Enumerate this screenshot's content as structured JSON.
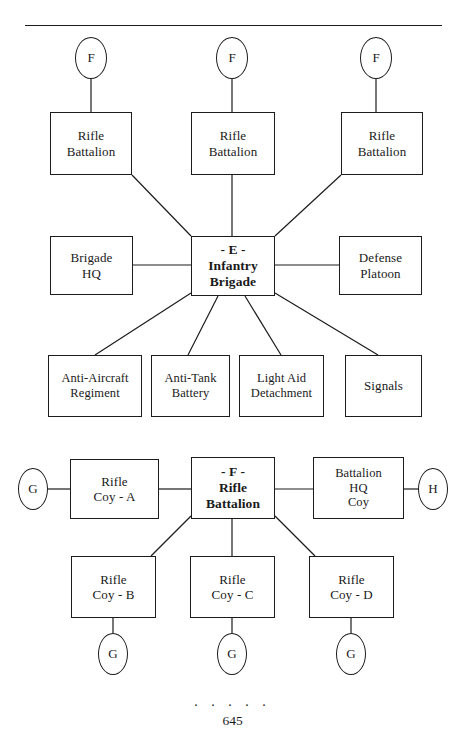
{
  "page": {
    "page_number": "645",
    "footer_dots": ". . . . .",
    "separator_rule": true
  },
  "diagram_e": {
    "title_code": "- E -",
    "center": {
      "lines": [
        "- E -",
        "Infantry",
        "Brigade"
      ]
    },
    "top_row_units": [
      {
        "lines": [
          "Rifle",
          "Battalion"
        ],
        "badge": "F"
      },
      {
        "lines": [
          "Rifle",
          "Battalion"
        ],
        "badge": "F"
      },
      {
        "lines": [
          "Rifle",
          "Battalion"
        ],
        "badge": "F"
      }
    ],
    "left_unit": {
      "lines": [
        "Brigade",
        "HQ"
      ]
    },
    "right_unit": {
      "lines": [
        "Defense",
        "Platoon"
      ]
    },
    "bottom_row_units": [
      {
        "lines": [
          "Anti-Aircraft",
          "Regiment"
        ]
      },
      {
        "lines": [
          "Anti-Tank",
          "Battery"
        ]
      },
      {
        "lines": [
          "Light Aid",
          "Detachment"
        ]
      },
      {
        "lines": [
          "Signals"
        ]
      }
    ]
  },
  "diagram_f": {
    "title_code": "- F -",
    "center": {
      "lines": [
        "- F -",
        "Rifle",
        "Battalion"
      ]
    },
    "left_unit": {
      "lines": [
        "Rifle",
        "Coy - A"
      ],
      "badge": "G"
    },
    "right_unit": {
      "lines": [
        "Battalion",
        "HQ",
        "Coy"
      ],
      "badge": "H"
    },
    "bottom_row_units": [
      {
        "lines": [
          "Rifle",
          "Coy - B"
        ],
        "badge": "G"
      },
      {
        "lines": [
          "Rifle",
          "Coy - C"
        ],
        "badge": "G"
      },
      {
        "lines": [
          "Rifle",
          "Coy - D"
        ],
        "badge": "G"
      }
    ]
  },
  "colors": {
    "ink": "#1c1c1c",
    "paper": "#ffffff"
  }
}
